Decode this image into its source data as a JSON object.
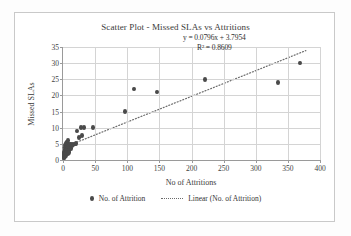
{
  "chart_data": {
    "type": "scatter",
    "title": "Scatter Plot - Missed SLAs vs Attritions",
    "xlabel": "No of Attritions",
    "ylabel": "Missed SLAs",
    "xlim": [
      0,
      400
    ],
    "ylim": [
      0,
      35
    ],
    "xticks": [
      0,
      50,
      100,
      150,
      200,
      250,
      300,
      350,
      400
    ],
    "yticks": [
      0,
      5,
      10,
      15,
      20,
      25,
      30,
      35
    ],
    "grid": true,
    "legend_position": "bottom",
    "series": [
      {
        "name": "No. of Attrition",
        "type": "scatter",
        "marker_color": "#4a4a4a",
        "points": [
          [
            1,
            0.6
          ],
          [
            1,
            1.2
          ],
          [
            1.5,
            2.0
          ],
          [
            2,
            0.8
          ],
          [
            2,
            1.6
          ],
          [
            2,
            2.4
          ],
          [
            2.5,
            3.2
          ],
          [
            3,
            1.0
          ],
          [
            3,
            2.0
          ],
          [
            3,
            3.0
          ],
          [
            3,
            4.0
          ],
          [
            3.5,
            4.6
          ],
          [
            4,
            1.4
          ],
          [
            4,
            2.6
          ],
          [
            4,
            3.6
          ],
          [
            4,
            4.4
          ],
          [
            4.5,
            5.2
          ],
          [
            5,
            2.2
          ],
          [
            5,
            3.2
          ],
          [
            5,
            4.2
          ],
          [
            5,
            5.0
          ],
          [
            5.5,
            5.6
          ],
          [
            6,
            2.8
          ],
          [
            6,
            3.8
          ],
          [
            6,
            4.8
          ],
          [
            6.5,
            5.4
          ],
          [
            7,
            3.4
          ],
          [
            7,
            4.4
          ],
          [
            7,
            5.2
          ],
          [
            7.5,
            6.0
          ],
          [
            8,
            2.0
          ],
          [
            8,
            4.0
          ],
          [
            8,
            5.0
          ],
          [
            9,
            3.0
          ],
          [
            9,
            4.6
          ],
          [
            10,
            2.4
          ],
          [
            10,
            4.2
          ],
          [
            11,
            5.0
          ],
          [
            12,
            3.6
          ],
          [
            13,
            4.8
          ],
          [
            14,
            4.4
          ],
          [
            15,
            5.0
          ],
          [
            16,
            4.6
          ],
          [
            18,
            5.0
          ],
          [
            20,
            5.2
          ],
          [
            22,
            9.0
          ],
          [
            25,
            7.0
          ],
          [
            28,
            10.0
          ],
          [
            30,
            7.5
          ],
          [
            32,
            10.0
          ],
          [
            46,
            10.0
          ],
          [
            97,
            15.0
          ],
          [
            110,
            22.0
          ],
          [
            147,
            21.0
          ],
          [
            221,
            25.0
          ],
          [
            335,
            24.0
          ],
          [
            369,
            30.0
          ]
        ]
      },
      {
        "name": "Linear (No. of Attrition)",
        "type": "trendline",
        "style": "dotted",
        "color": "#6b6b6b",
        "slope": 0.0796,
        "intercept": 3.7954,
        "r_squared": 0.8609,
        "equation_label": "y = 0.0796x + 3.7954",
        "r2_label": "R² = 0.8609",
        "x_start": 0,
        "x_end": 378
      }
    ]
  },
  "legend": {
    "items": [
      {
        "label": "No. of Attrition",
        "marker": "dot"
      },
      {
        "label": "Linear (No. of Attrition)",
        "marker": "dotted-line"
      }
    ]
  }
}
